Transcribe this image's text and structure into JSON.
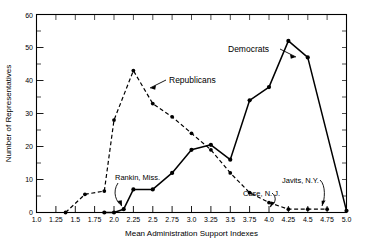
{
  "chart_data": {
    "type": "line",
    "title": "",
    "xlabel": "Mean Administration Support Indexes",
    "ylabel": "Number of Representatives",
    "xlim": [
      1.0,
      5.0
    ],
    "ylim": [
      0,
      60
    ],
    "xticks": [
      "1.0",
      "1.25",
      "1.5",
      "1.75",
      "2.0",
      "2.25",
      "2.5",
      "2.75",
      "3.0",
      "3.25",
      "3.5",
      "3.75",
      "4.0",
      "4.25",
      "4.5",
      "4.75",
      "5.0"
    ],
    "yticks": [
      "0",
      "10",
      "20",
      "30",
      "40",
      "50",
      "60"
    ],
    "grid": false,
    "legend_position": "inline-annotations",
    "series": [
      {
        "name": "Republicans",
        "style": "dashed",
        "x": [
          1.375,
          1.625,
          1.875,
          2.0,
          2.25,
          2.5,
          2.75,
          3.0,
          3.25,
          3.5,
          3.75,
          4.0,
          4.25,
          4.5,
          4.75
        ],
        "values": [
          0,
          5.5,
          6.5,
          28,
          43,
          33,
          29,
          24,
          19,
          12,
          6,
          3,
          1,
          1,
          1
        ]
      },
      {
        "name": "Democrats",
        "style": "solid",
        "x": [
          1.875,
          2.0,
          2.125,
          2.25,
          2.5,
          2.75,
          3.0,
          3.25,
          3.5,
          3.75,
          4.0,
          4.25,
          4.5,
          5.0
        ],
        "values": [
          0,
          0,
          1,
          7,
          7,
          12,
          19,
          20.5,
          16,
          34,
          38,
          52,
          47,
          0.5
        ]
      }
    ],
    "annotations": [
      {
        "text": "Republicans",
        "points_to_x": 2.45,
        "points_to_y": 34
      },
      {
        "text": "Democrats",
        "points_to_x": 4.12,
        "points_to_y": 44
      },
      {
        "text": "Rankin, Miss.",
        "points_to_x": 2.125,
        "points_to_y": 1
      },
      {
        "text": "Case, N. J.",
        "points_to_x": 4.0,
        "points_to_y": 3
      },
      {
        "text": "Javits, N.Y.",
        "points_to_x": 4.75,
        "points_to_y": 1
      }
    ]
  }
}
